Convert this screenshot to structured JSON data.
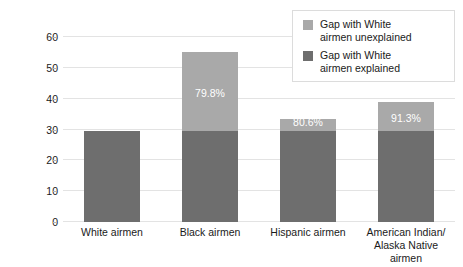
{
  "chart_data": {
    "type": "bar",
    "subtype": "stacked-bar",
    "title": "",
    "xlabel": "",
    "ylabel": "Rate per 1,000 airmen",
    "ylim": [
      0,
      60
    ],
    "yticks": [
      0,
      10,
      20,
      30,
      40,
      50,
      60
    ],
    "grid": true,
    "legend_position": "top-right",
    "categories": [
      "White airmen",
      "Black airmen",
      "Hispanic airmen",
      "American Indian/\nAlaska Native airmen"
    ],
    "series": [
      {
        "name": "Gap with White airmen explained",
        "color": "#6e6e6e",
        "values": [
          29.6,
          29.6,
          29.6,
          29.6
        ]
      },
      {
        "name": "Gap with White airmen unexplained",
        "color": "#a9a9a9",
        "values": [
          0,
          25.4,
          3.7,
          9.2
        ]
      }
    ],
    "totals": [
      29.6,
      55.0,
      33.3,
      38.8
    ],
    "annotations": [
      {
        "category": "Black airmen",
        "text": "79.8%"
      },
      {
        "category": "Hispanic airmen",
        "text": "80.6%"
      },
      {
        "category": "American Indian/Alaska Native airmen",
        "text": "91.3%"
      }
    ]
  },
  "axis": {
    "y_title": "Rate per 1,000 airmen",
    "y_ticks": [
      "0",
      "10",
      "20",
      "30",
      "40",
      "50",
      "60"
    ],
    "x_ticks": [
      "White airmen",
      "Black airmen",
      "Hispanic airmen",
      "American Indian/\nAlaska Native airmen"
    ]
  },
  "bars": [
    {
      "category": "White airmen",
      "explained": 29.6,
      "unexplained": 0,
      "label": ""
    },
    {
      "category": "Black airmen",
      "explained": 29.6,
      "unexplained": 25.4,
      "label": "79.8%"
    },
    {
      "category": "Hispanic airmen",
      "explained": 29.6,
      "unexplained": 3.7,
      "label": "80.6%"
    },
    {
      "category": "American Indian/Alaska Native airmen",
      "explained": 29.6,
      "unexplained": 9.2,
      "label": "91.3%"
    }
  ],
  "legend": {
    "items": [
      {
        "label": "Gap with White\nairmen unexplained",
        "color": "#a9a9a9"
      },
      {
        "label": "Gap with White\nairmen explained",
        "color": "#6e6e6e"
      }
    ]
  },
  "colors": {
    "explained": "#6e6e6e",
    "unexplained": "#a9a9a9",
    "gridline": "#e3e3e3",
    "text": "#1a1a1a",
    "background": "#ffffff"
  }
}
